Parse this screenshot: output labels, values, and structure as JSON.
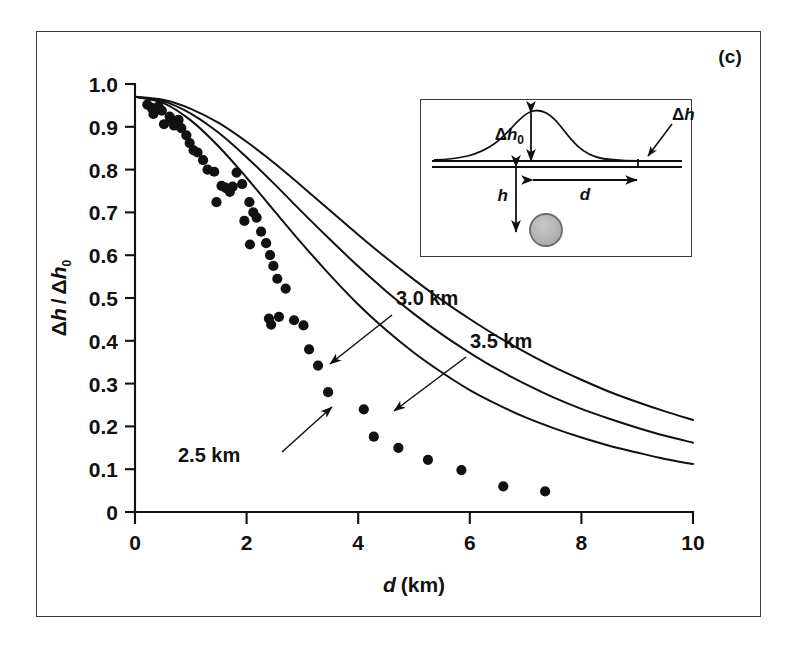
{
  "panel": {
    "label": "(c)"
  },
  "axes": {
    "xlabel_sym": "d",
    "xlabel_unit": "(km)",
    "ylabel": "Δh / Δh0",
    "xticks": [
      "0",
      "2",
      "4",
      "6",
      "8",
      "10"
    ],
    "yticks": [
      "0",
      "0.1",
      "0.2",
      "0.3",
      "0.4",
      "0.5",
      "0.6",
      "0.7",
      "0.8",
      "0.9",
      "1.0"
    ]
  },
  "annotations": [
    {
      "id": "ann-25",
      "text": "2.5 km"
    },
    {
      "id": "ann-30",
      "text": "3.0 km"
    },
    {
      "id": "ann-35",
      "text": "3.5 km"
    }
  ],
  "inset": {
    "labels": {
      "dh0_sym": "Δh",
      "dh0_sub": "0",
      "dh_sym": "Δh",
      "d_sym": "d",
      "h_sym": "h"
    }
  },
  "chart_data": {
    "type": "line",
    "title": "",
    "xlabel": "d (km)",
    "ylabel": "Δh / Δh0",
    "xlim": [
      0,
      10
    ],
    "ylim": [
      0,
      1.0
    ],
    "xticks": [
      0,
      2,
      4,
      6,
      8,
      10
    ],
    "yticks": [
      0,
      0.1,
      0.2,
      0.3,
      0.4,
      0.5,
      0.6,
      0.7,
      0.8,
      0.9,
      1.0
    ],
    "grid": false,
    "legend_position": "inline-annotations",
    "series": [
      {
        "name": "2.5 km",
        "model": "dh/dh0 = 0.97 / (1 + (d/(2*2.5))^2)^1.5",
        "x": [
          0,
          0.5,
          1.0,
          1.5,
          2.0,
          2.5,
          3.0,
          3.5,
          4.0,
          4.5,
          5.0,
          5.5,
          6.0,
          6.5,
          7.0,
          7.5,
          8.0,
          8.5,
          9.0,
          9.5,
          10.0
        ],
        "y": [
          0.97,
          0.956,
          0.915,
          0.854,
          0.781,
          0.703,
          0.626,
          0.553,
          0.485,
          0.425,
          0.372,
          0.326,
          0.285,
          0.251,
          0.221,
          0.196,
          0.174,
          0.155,
          0.139,
          0.124,
          0.112
        ]
      },
      {
        "name": "3.0 km",
        "model": "dh/dh0 = 0.97 / (1 + (d/(2*3.0))^2)^1.5",
        "x": [
          0,
          0.5,
          1.0,
          1.5,
          2.0,
          2.5,
          3.0,
          3.5,
          4.0,
          4.5,
          5.0,
          5.5,
          6.0,
          6.5,
          7.0,
          7.5,
          8.0,
          8.5,
          9.0,
          9.5,
          10.0
        ],
        "y": [
          0.97,
          0.96,
          0.931,
          0.886,
          0.829,
          0.766,
          0.7,
          0.636,
          0.574,
          0.516,
          0.463,
          0.415,
          0.372,
          0.333,
          0.299,
          0.268,
          0.241,
          0.218,
          0.197,
          0.178,
          0.162
        ]
      },
      {
        "name": "3.5 km",
        "model": "dh/dh0 = 0.97 / (1 + (d/(2*3.5))^2)^1.5",
        "x": [
          0,
          0.5,
          1.0,
          1.5,
          2.0,
          2.5,
          3.0,
          3.5,
          4.0,
          4.5,
          5.0,
          5.5,
          6.0,
          6.5,
          7.0,
          7.5,
          8.0,
          8.5,
          9.0,
          9.5,
          10.0
        ],
        "y": [
          0.97,
          0.963,
          0.942,
          0.909,
          0.865,
          0.815,
          0.76,
          0.704,
          0.648,
          0.594,
          0.543,
          0.495,
          0.451,
          0.41,
          0.373,
          0.339,
          0.309,
          0.281,
          0.257,
          0.235,
          0.215
        ]
      }
    ],
    "scatter": {
      "name": "observations",
      "marker": "filled-circle",
      "points": [
        [
          0.22,
          0.952
        ],
        [
          0.3,
          0.944
        ],
        [
          0.33,
          0.93
        ],
        [
          0.42,
          0.947
        ],
        [
          0.48,
          0.938
        ],
        [
          0.52,
          0.906
        ],
        [
          0.62,
          0.924
        ],
        [
          0.66,
          0.916
        ],
        [
          0.7,
          0.903
        ],
        [
          0.78,
          0.916
        ],
        [
          0.83,
          0.897
        ],
        [
          0.92,
          0.88
        ],
        [
          0.98,
          0.862
        ],
        [
          1.05,
          0.845
        ],
        [
          1.12,
          0.84
        ],
        [
          1.22,
          0.822
        ],
        [
          1.3,
          0.8
        ],
        [
          1.42,
          0.795
        ],
        [
          1.55,
          0.762
        ],
        [
          1.62,
          0.758
        ],
        [
          1.66,
          0.755
        ],
        [
          1.7,
          0.748
        ],
        [
          1.75,
          0.76
        ],
        [
          1.82,
          0.793
        ],
        [
          1.46,
          0.724
        ],
        [
          1.92,
          0.766
        ],
        [
          1.96,
          0.68
        ],
        [
          2.05,
          0.724
        ],
        [
          2.12,
          0.7
        ],
        [
          2.18,
          0.688
        ],
        [
          2.26,
          0.655
        ],
        [
          2.06,
          0.625
        ],
        [
          2.35,
          0.628
        ],
        [
          2.42,
          0.6
        ],
        [
          2.48,
          0.575
        ],
        [
          2.55,
          0.545
        ],
        [
          2.7,
          0.522
        ],
        [
          2.58,
          0.456
        ],
        [
          2.4,
          0.452
        ],
        [
          2.44,
          0.438
        ],
        [
          2.85,
          0.448
        ],
        [
          3.02,
          0.436
        ],
        [
          3.12,
          0.38
        ],
        [
          3.28,
          0.342
        ],
        [
          3.46,
          0.28
        ],
        [
          4.1,
          0.24
        ],
        [
          4.28,
          0.176
        ],
        [
          4.72,
          0.15
        ],
        [
          5.25,
          0.122
        ],
        [
          5.85,
          0.098
        ],
        [
          6.6,
          0.06
        ],
        [
          7.35,
          0.048
        ]
      ]
    }
  }
}
